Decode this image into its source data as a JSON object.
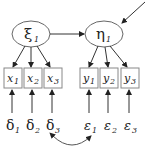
{
  "diagram": {
    "type": "structural-equation-model",
    "stroke_color": "#555555",
    "latent": [
      {
        "id": "xi1",
        "symbol": "ξ",
        "sub": "1"
      },
      {
        "id": "eta1",
        "symbol": "η",
        "sub": "1"
      }
    ],
    "observed_x": [
      {
        "symbol": "x",
        "sub": "1"
      },
      {
        "symbol": "x",
        "sub": "2"
      },
      {
        "symbol": "x",
        "sub": "3"
      }
    ],
    "observed_y": [
      {
        "symbol": "y",
        "sub": "1"
      },
      {
        "symbol": "y",
        "sub": "2"
      },
      {
        "symbol": "y",
        "sub": "3"
      }
    ],
    "errors_delta": [
      {
        "symbol": "δ",
        "sub": "1"
      },
      {
        "symbol": "δ",
        "sub": "2"
      },
      {
        "symbol": "δ",
        "sub": "3"
      }
    ],
    "errors_epsilon": [
      {
        "symbol": "ε",
        "sub": "1"
      },
      {
        "symbol": "ε",
        "sub": "2"
      },
      {
        "symbol": "ε",
        "sub": "3"
      }
    ],
    "paths": [
      "ξ1 -> η1",
      "disturbance -> η1",
      "ξ1 -> x1",
      "ξ1 -> x2",
      "ξ1 -> x3",
      "η1 -> y1",
      "η1 -> y2",
      "η1 -> y3",
      "δ1 -> x1",
      "δ2 -> x2",
      "δ3 -> x3",
      "ε1 -> y1",
      "ε2 -> y2",
      "ε3 -> y3",
      "δ3 <-> ε1"
    ]
  }
}
